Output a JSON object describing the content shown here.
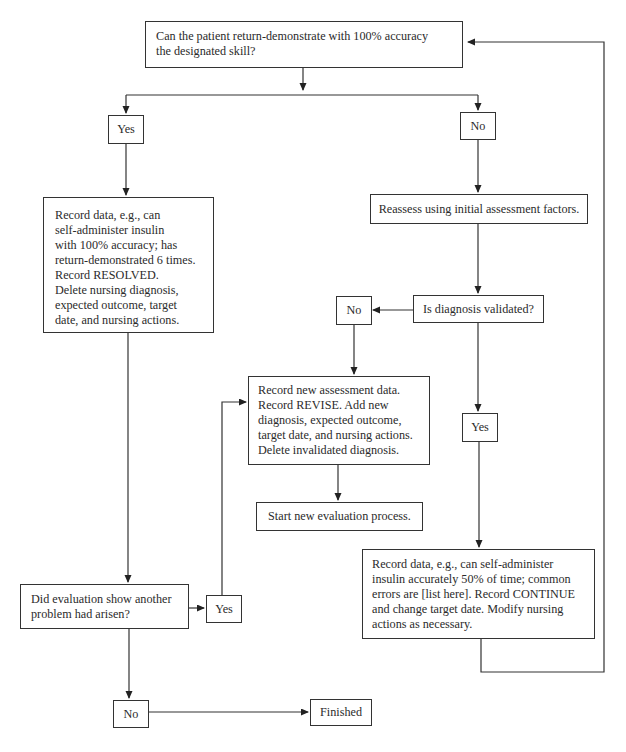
{
  "diagram": {
    "type": "flowchart",
    "nodes": {
      "start_question": {
        "lines": [
          "Can the patient return-demonstrate with 100% accuracy",
          "the designated skill?"
        ]
      },
      "yes_1": {
        "label": "Yes"
      },
      "no_1": {
        "label": "No"
      },
      "resolved": {
        "lines": [
          "Record data, e.g., can",
          "self-administer insulin",
          "with 100% accuracy; has",
          "return-demonstrated 6 times.",
          "Record RESOLVED.",
          "Delete nursing diagnosis,",
          "expected outcome, target",
          "date, and nursing actions."
        ]
      },
      "reassess": {
        "label": "Reassess using initial assessment factors."
      },
      "diagnosis_validated": {
        "label": "Is diagnosis validated?"
      },
      "no_2": {
        "label": "No"
      },
      "yes_2": {
        "label": "Yes"
      },
      "revise": {
        "lines": [
          "Record new assessment data.",
          "Record REVISE. Add new",
          "diagnosis, expected outcome,",
          "target date, and nursing actions.",
          "Delete invalidated diagnosis."
        ]
      },
      "start_new": {
        "label": "Start new evaluation process."
      },
      "continue": {
        "lines": [
          "Record data, e.g., can self-administer",
          "insulin accurately 50% of time; common",
          "errors are [list here]. Record CONTINUE",
          "and change target date. Modify nursing",
          "actions as necessary."
        ]
      },
      "another_problem": {
        "lines": [
          "Did evaluation show another",
          "problem had arisen?"
        ]
      },
      "yes_3": {
        "label": "Yes"
      },
      "no_3": {
        "label": "No"
      },
      "finished": {
        "label": "Finished"
      }
    },
    "edges": [
      [
        "start_question",
        "yes_1"
      ],
      [
        "start_question",
        "no_1"
      ],
      [
        "yes_1",
        "resolved"
      ],
      [
        "no_1",
        "reassess"
      ],
      [
        "reassess",
        "diagnosis_validated"
      ],
      [
        "diagnosis_validated",
        "no_2"
      ],
      [
        "diagnosis_validated",
        "yes_2"
      ],
      [
        "no_2",
        "revise"
      ],
      [
        "revise",
        "start_new"
      ],
      [
        "yes_2",
        "continue"
      ],
      [
        "continue",
        "start_question"
      ],
      [
        "resolved",
        "another_problem"
      ],
      [
        "another_problem",
        "yes_3"
      ],
      [
        "yes_3",
        "revise"
      ],
      [
        "another_problem",
        "no_3"
      ],
      [
        "no_3",
        "finished"
      ]
    ]
  }
}
